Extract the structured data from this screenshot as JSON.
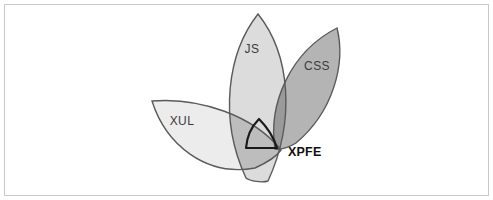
{
  "figure": {
    "background_color": "#ffffff",
    "border_color": "#c9c9c9"
  },
  "diagram": {
    "type": "venn",
    "set_count": 3,
    "shape": "petal",
    "convergence_point": {
      "x": 277,
      "y": 148
    },
    "sets": [
      {
        "id": "js",
        "label": "JS",
        "label_x": 252,
        "label_y": 53,
        "fill_color": "#dcdcdc",
        "stroke_color": "#5a5a5a",
        "tip": {
          "x": 258,
          "y": 14
        },
        "orientation": "vertical"
      },
      {
        "id": "css",
        "label": "CSS",
        "label_x": 317,
        "label_y": 70,
        "fill_color": "#b4b4b4",
        "stroke_color": "#5a5a5a",
        "tip": {
          "x": 337,
          "y": 28
        },
        "orientation": "tilted-right"
      },
      {
        "id": "xul",
        "label": "XUL",
        "label_x": 182,
        "label_y": 125,
        "fill_color": "#ececec",
        "stroke_color": "#5a5a5a",
        "tip": {
          "x": 152,
          "y": 101
        },
        "orientation": "tilted-left"
      }
    ],
    "intersection": {
      "id": "xpfe",
      "label": "XPFE",
      "label_x": 288,
      "label_y": 156,
      "description": "intersection of JS, CSS and XUL",
      "fill_color": "#6f6f6f",
      "stroke_color": "#1a1a1a",
      "stroke_width": 2
    },
    "overlap_colors": {
      "js_css": "#9a9a9a",
      "js_xul": "#bdbdbd",
      "css_xul": "#a8a8a8",
      "triple": "#6f6f6f"
    }
  }
}
